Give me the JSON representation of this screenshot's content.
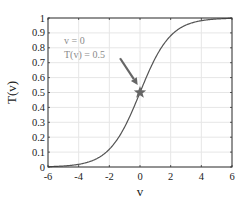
{
  "chart_data": {
    "type": "line",
    "title": "",
    "xlabel": "v",
    "ylabel": "T(v)",
    "xlim": [
      -6,
      6
    ],
    "ylim": [
      0,
      1
    ],
    "x_ticks": [
      "-6",
      "-4",
      "-2",
      "0",
      "2",
      "4",
      "6"
    ],
    "y_ticks": [
      "0",
      "0.1",
      "0.2",
      "0.3",
      "0.4",
      "0.5",
      "0.6",
      "0.7",
      "0.8",
      "0.9",
      "1"
    ],
    "grid": true,
    "series": [
      {
        "name": "T(v)",
        "function": "sigmoid 1/(1+exp(-v))",
        "x": [
          -6,
          -5,
          -4,
          -3,
          -2,
          -1,
          0,
          1,
          2,
          3,
          4,
          5,
          6
        ],
        "y": [
          0.002,
          0.007,
          0.018,
          0.047,
          0.119,
          0.269,
          0.5,
          0.731,
          0.881,
          0.953,
          0.982,
          0.993,
          0.998
        ],
        "color": "#555555"
      }
    ],
    "annotations": [
      {
        "type": "marker",
        "shape": "star",
        "x": 0,
        "y": 0.5,
        "color": "#666666"
      },
      {
        "type": "text",
        "lines": [
          "v = 0",
          "T(v) = 0.5"
        ],
        "color": "#8a8a8a"
      },
      {
        "type": "arrow",
        "from": [
          -1.3,
          0.73
        ],
        "to": [
          -0.15,
          0.55
        ],
        "color": "#666666"
      }
    ]
  },
  "labels": {
    "xlabel": "v",
    "ylabel": "T(v)",
    "annotation_line1": "v = 0",
    "annotation_line2": "T(v) = 0.5"
  }
}
